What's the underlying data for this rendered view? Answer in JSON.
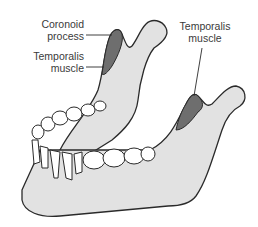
{
  "diagram": {
    "labels": {
      "coronoid_process": [
        "Coronoid",
        "process"
      ],
      "temporalis_left": [
        "Temporalis",
        "muscle"
      ],
      "temporalis_right": [
        "Temporalis",
        "muscle"
      ]
    },
    "colors": {
      "bone": "#e2e2e2",
      "outline": "#2a2a2a",
      "muscle": "#6e6e6e",
      "teeth": "#ffffff",
      "text": "#3a3a3a"
    }
  }
}
